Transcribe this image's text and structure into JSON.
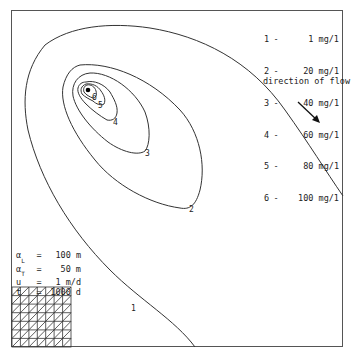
{
  "legend": {
    "items": [
      {
        "id": "1",
        "sep": "-",
        "value": "1 mg/1"
      },
      {
        "id": "2",
        "sep": "-",
        "value": "20 mg/1"
      },
      {
        "id": "3",
        "sep": "-",
        "value": "40 mg/1"
      },
      {
        "id": "4",
        "sep": "-",
        "value": "60 mg/1"
      },
      {
        "id": "5",
        "sep": "-",
        "value": "80 mg/1"
      },
      {
        "id": "6",
        "sep": "-",
        "value": "100 mg/1"
      }
    ]
  },
  "flow": {
    "label": "direction of flow",
    "arrow_icon": "arrow-down-right"
  },
  "params": [
    {
      "symbol": "α",
      "subscript": "L",
      "eq": "=",
      "value": "100 m"
    },
    {
      "symbol": "α",
      "subscript": "T",
      "eq": "=",
      "value": "50 m"
    },
    {
      "symbol": "u",
      "subscript": "",
      "eq": "=",
      "value": "1 m/d"
    },
    {
      "symbol": "t",
      "subscript": "",
      "eq": "=",
      "value": "1000 d"
    }
  ],
  "contour_labels": [
    {
      "label": "1",
      "x": 134,
      "y": 311
    },
    {
      "label": "2",
      "x": 192,
      "y": 212
    },
    {
      "label": "3",
      "x": 147,
      "y": 156
    },
    {
      "label": "4",
      "x": 116,
      "y": 125
    },
    {
      "label": "5",
      "x": 101,
      "y": 108
    },
    {
      "label": "6",
      "x": 95,
      "y": 99
    }
  ],
  "source_point": {
    "x": 88,
    "y": 90
  },
  "mesh": {
    "columns": 7,
    "rows": 7
  }
}
